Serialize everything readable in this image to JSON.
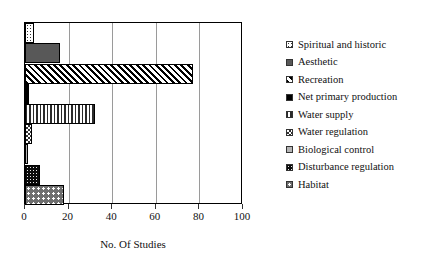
{
  "chart_data": {
    "type": "bar",
    "orientation": "horizontal",
    "title": "",
    "xlabel": "No. Of Studies",
    "ylabel": "",
    "xlim": [
      0,
      100
    ],
    "ylim": [
      0,
      9
    ],
    "xticks": [
      "0",
      "20",
      "40",
      "60",
      "80",
      "100"
    ],
    "grid": "vertical gridlines at each x tick",
    "legend_position": "right",
    "categories": [
      "Spiritual and historic",
      "Aesthetic",
      "Recreation",
      "Net primary production",
      "Water supply",
      "Water regulation",
      "Biological control",
      "Disturbance regulation",
      "Habitat"
    ],
    "values": [
      4,
      16,
      77,
      2,
      32,
      3,
      1,
      7,
      18
    ],
    "series": [
      {
        "name": "No. Of Studies",
        "values": [
          4,
          16,
          77,
          2,
          32,
          3,
          1,
          7,
          18
        ]
      }
    ],
    "bars": [
      {
        "label": "Spiritual and historic",
        "value": 4,
        "pattern": "sparse-dot",
        "swatch": "pat-sparse-dot"
      },
      {
        "label": "Aesthetic",
        "value": 16,
        "pattern": "solid-gray",
        "swatch": "pat-solid-gray"
      },
      {
        "label": "Recreation",
        "value": 77,
        "pattern": "diagonal",
        "swatch": "pat-diag"
      },
      {
        "label": "Net primary production",
        "value": 2,
        "pattern": "black",
        "swatch": "pat-black"
      },
      {
        "label": "Water supply",
        "value": 32,
        "pattern": "vlines",
        "swatch": "pat-vlines"
      },
      {
        "label": "Water regulation",
        "value": 3,
        "pattern": "checker",
        "swatch": "pat-checker"
      },
      {
        "label": "Biological control",
        "value": 1,
        "pattern": "light-gray",
        "swatch": "pat-light-gray"
      },
      {
        "label": "Disturbance regulation",
        "value": 7,
        "pattern": "dots-black",
        "swatch": "pat-dots-black"
      },
      {
        "label": "Habitat",
        "value": 18,
        "pattern": "dots-gray",
        "swatch": "pat-dots-gray"
      }
    ]
  },
  "legend": {
    "items": [
      {
        "label": "Spiritual and historic"
      },
      {
        "label": "Aesthetic"
      },
      {
        "label": "Recreation"
      },
      {
        "label": "Net primary production"
      },
      {
        "label": "Water supply"
      },
      {
        "label": "Water regulation"
      },
      {
        "label": "Biological control"
      },
      {
        "label": "Disturbance regulation"
      },
      {
        "label": "Habitat"
      }
    ]
  },
  "colors": {
    "axis": "#333333",
    "frame": "#000000",
    "grid": "#9a9a9a",
    "background": "#ffffff",
    "text": "#111111"
  }
}
